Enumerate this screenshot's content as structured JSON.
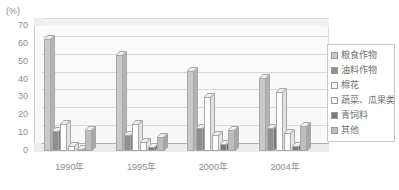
{
  "chart_data": {
    "type": "bar",
    "title": "",
    "subtitle": "",
    "unit_label": "(%)",
    "xlabel": "",
    "ylabel": "",
    "ylim": [
      0,
      70
    ],
    "ytick_step": 10,
    "yticks": [
      "70",
      "60",
      "50",
      "40",
      "30",
      "20",
      "10",
      "0"
    ],
    "grid": true,
    "legend_position": "right",
    "style": "3d-grouped-column-grayscale",
    "categories": [
      "1990年",
      "1995年",
      "2000年",
      "2004年"
    ],
    "series": [
      {
        "name": "粮食作物",
        "color": "#c9c9c9",
        "values": [
          63,
          54,
          45,
          41
        ]
      },
      {
        "name": "油料作物",
        "color": "#8f8f8f",
        "values": [
          11,
          9,
          13,
          13
        ]
      },
      {
        "name": "棉花",
        "color": "#ffffff",
        "values": [
          15,
          15,
          30,
          33
        ]
      },
      {
        "name": "蔬菜、瓜果类",
        "color": "#fbfbfb",
        "values": [
          3,
          5,
          9,
          10
        ]
      },
      {
        "name": "青饲料",
        "color": "#7b7b7b",
        "values": [
          1,
          2,
          4,
          3
        ]
      },
      {
        "name": "其他",
        "color": "#bdbdbd",
        "values": [
          12,
          8,
          12,
          14
        ]
      }
    ]
  }
}
